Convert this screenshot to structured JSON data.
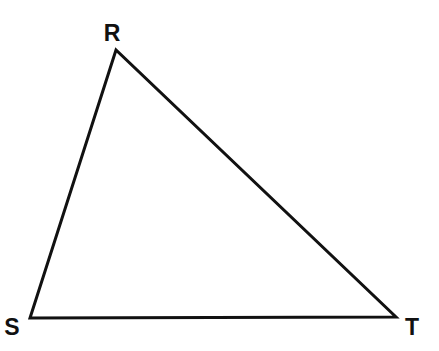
{
  "figure": {
    "kind": "geometry-diagram",
    "shape_name": "triangle",
    "background_color": "#ffffff",
    "stroke_color": "#111111",
    "stroke_width": 3,
    "label_color": "#111111",
    "canvas": {
      "width": 439,
      "height": 351
    }
  },
  "chart_data": {
    "type": "diagram",
    "title": "",
    "subtitle": "",
    "xlabel": "",
    "ylabel": "",
    "grid": false,
    "legend": null,
    "shape": "triangle",
    "vertices": [
      {
        "name": "R",
        "x": 116,
        "y": 50,
        "label_x": 112,
        "label_y": 33
      },
      {
        "name": "S",
        "x": 30,
        "y": 318,
        "label_x": 12,
        "label_y": 327
      },
      {
        "name": "T",
        "x": 396,
        "y": 317,
        "label_x": 412,
        "label_y": 327
      }
    ],
    "edges": [
      {
        "name": "RS",
        "from": "R",
        "to": "S",
        "label": ""
      },
      {
        "name": "RT",
        "from": "R",
        "to": "T",
        "label": ""
      },
      {
        "name": "ST",
        "from": "S",
        "to": "T",
        "label": ""
      }
    ],
    "polygon_points": "116,50 396,317 30,318",
    "annotations": []
  },
  "labels": {
    "r": "R",
    "s": "S",
    "t": "T"
  }
}
